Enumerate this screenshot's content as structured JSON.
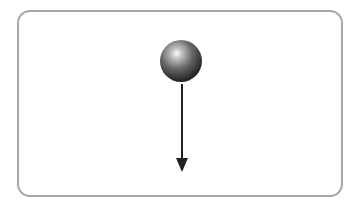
{
  "diagram": {
    "title": "",
    "elements": [
      {
        "type": "ball",
        "description": "dark glossy sphere"
      },
      {
        "type": "arrow",
        "direction": "down",
        "description": "force vector pointing downward"
      }
    ],
    "colors": {
      "border": "#a6a6a6",
      "ball": "#2a2a2a",
      "arrow": "#222222"
    }
  }
}
